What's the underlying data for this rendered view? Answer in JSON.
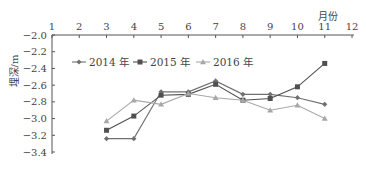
{
  "chart_data": {
    "type": "line",
    "title": "",
    "xlabel": "月份",
    "ylabel": "埋深/m",
    "x_axis_position": "top",
    "xlim": [
      1,
      12
    ],
    "ylim": [
      -3.4,
      -2.0
    ],
    "x_ticks": [
      "1",
      "2",
      "3",
      "4",
      "5",
      "6",
      "7",
      "8",
      "9",
      "10",
      "11",
      "12"
    ],
    "y_ticks": [
      "-2.0",
      "-2.2",
      "-2.4",
      "-2.6",
      "-2.8",
      "-3.0",
      "-3.2",
      "-3.4"
    ],
    "grid": false,
    "legend_position": "upper-left inside",
    "x": [
      3,
      4,
      5,
      6,
      7,
      8,
      9,
      10,
      11
    ],
    "series": [
      {
        "name": "2014 年",
        "marker": "diamond",
        "color": "#707070",
        "values": [
          -3.24,
          -3.24,
          -2.68,
          -2.68,
          -2.55,
          -2.71,
          -2.71,
          -2.75,
          -2.83
        ]
      },
      {
        "name": "2015 年",
        "marker": "square",
        "color": "#505050",
        "values": [
          -3.14,
          -2.97,
          -2.72,
          -2.71,
          -2.59,
          -2.78,
          -2.76,
          -2.62,
          -2.34
        ]
      },
      {
        "name": "2016 年",
        "marker": "triangle",
        "color": "#a8a8a8",
        "values": [
          -3.03,
          -2.78,
          -2.83,
          -2.7,
          -2.75,
          -2.78,
          -2.9,
          -2.84,
          -3.0
        ]
      }
    ]
  },
  "labels": {
    "x_title": "月份",
    "y_title": "埋深/m"
  }
}
